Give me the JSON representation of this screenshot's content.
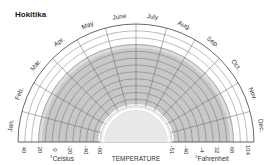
{
  "title": "Hokitika",
  "chart_data": {
    "type": "radial-band",
    "title": "Hokitika",
    "xlabel": "TEMPERATURE",
    "categories": [
      "Jan.",
      "Feb.",
      "Mar.",
      "Apr.",
      "May",
      "June",
      "July",
      "Aug.",
      "Sep.",
      "Oct.",
      "Nov.",
      "Dec."
    ],
    "celsius_axis": {
      "unit": "°Celsius",
      "tick_labels_outer_to_inner": [
        "40",
        "20",
        "0",
        "-20",
        "-40",
        "-60"
      ]
    },
    "fahrenheit_axis": {
      "unit": "°Fahrenheit",
      "tick_labels_inner_to_outer": [
        "-51",
        "-40",
        "-4",
        "32",
        "68",
        "104"
      ]
    },
    "axis_note": "Tick labels transcribed exactly as printed. The innermost Fahrenheit label (-51) does not correspond to the innermost Celsius label (-60, which would be -76°F), so the two scales are not a consistent conversion at the inner edge.",
    "band_radius_px": {
      "inner": 38,
      "outer": 94
    },
    "band_note": "Grey band covers roughly the same radial span in every month. Temperature bounds are not stated, because converting radius to degrees depends on the inconsistent axis.",
    "grid": true,
    "colors": {
      "band": "#c8c8c8",
      "band_edge": "#dcdcdc",
      "grid": "#555555",
      "inner_fill": "#e8e8e8"
    }
  },
  "labels": {
    "celsius_unit": "°Celsius",
    "fahrenheit_unit": "°Fahrenheit",
    "axis_title": "TEMPERATURE"
  }
}
